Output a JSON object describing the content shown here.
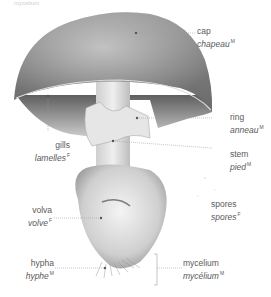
{
  "diagram": {
    "top_partial_text": "mycelium",
    "labels": [
      {
        "id": "cap",
        "en": "cap",
        "fr": "chapeau",
        "gender": "M"
      },
      {
        "id": "ring",
        "en": "ring",
        "fr": "anneau",
        "gender": "M"
      },
      {
        "id": "gills",
        "en": "gills",
        "fr": "lamelles",
        "gender": "F"
      },
      {
        "id": "stem",
        "en": "stem",
        "fr": "pied",
        "gender": "M"
      },
      {
        "id": "spores",
        "en": "spores",
        "fr": "spores",
        "gender": "F"
      },
      {
        "id": "volva",
        "en": "volva",
        "fr": "volve",
        "gender": "F"
      },
      {
        "id": "hypha",
        "en": "hypha",
        "fr": "hyphe",
        "gender": "M"
      },
      {
        "id": "mycelium",
        "en": "mycelium",
        "fr": "mycélium",
        "gender": "M"
      }
    ],
    "colors": {
      "cap_dark": "#7a7a7a",
      "cap_light": "#bdbdbd",
      "leader_line": "#9a9a9a",
      "text": "#5a5a5a"
    }
  }
}
